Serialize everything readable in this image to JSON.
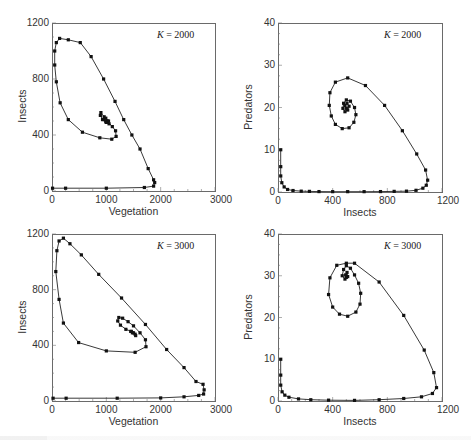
{
  "chart_data": [
    {
      "id": "tl",
      "type": "line",
      "title": "",
      "annotation": {
        "var": "K",
        "text": " = 2000"
      },
      "xlabel": "Vegetation",
      "ylabel": "Insects",
      "xlim": [
        0,
        3000
      ],
      "ylim": [
        0,
        1200
      ],
      "xticks": [
        0,
        1000,
        2000,
        3000
      ],
      "yticks": [
        0,
        400,
        800,
        1200
      ],
      "frame": {
        "left": 52,
        "top": 23,
        "right": 215,
        "bottom": 191
      },
      "grid": false,
      "series": [
        {
          "name": "trajectory",
          "points": [
            [
              10,
              20
            ],
            [
              250,
              20
            ],
            [
              1000,
              20
            ],
            [
              1700,
              25
            ],
            [
              1870,
              35
            ],
            [
              1890,
              60
            ],
            [
              1870,
              80
            ],
            [
              1770,
              160
            ],
            [
              1620,
              300
            ],
            [
              1470,
              400
            ],
            [
              1320,
              510
            ],
            [
              1160,
              640
            ],
            [
              950,
              800
            ],
            [
              720,
              960
            ],
            [
              520,
              1060
            ],
            [
              300,
              1080
            ],
            [
              140,
              1090
            ],
            [
              80,
              1060
            ],
            [
              50,
              1000
            ],
            [
              50,
              900
            ],
            [
              80,
              780
            ],
            [
              150,
              630
            ],
            [
              300,
              510
            ],
            [
              560,
              420
            ],
            [
              880,
              380
            ],
            [
              1100,
              370
            ],
            [
              1180,
              390
            ],
            [
              1170,
              430
            ],
            [
              1110,
              460
            ],
            [
              1020,
              500
            ],
            [
              960,
              530
            ],
            [
              900,
              560
            ],
            [
              890,
              540
            ],
            [
              930,
              510
            ],
            [
              1000,
              490
            ],
            [
              1050,
              480
            ],
            [
              1040,
              500
            ],
            [
              990,
              520
            ],
            [
              960,
              510
            ],
            [
              990,
              495
            ]
          ]
        }
      ]
    },
    {
      "id": "tr",
      "type": "line",
      "title": "",
      "annotation": {
        "var": "K",
        "text": " = 2000"
      },
      "xlabel": "Insects",
      "ylabel": "Predators",
      "xlim": [
        0,
        1200
      ],
      "ylim": [
        0,
        40
      ],
      "xticks": [
        0,
        400,
        800,
        1200
      ],
      "yticks": [
        0,
        10,
        20,
        30,
        40
      ],
      "frame": {
        "left": 278,
        "top": 23,
        "right": 442,
        "bottom": 192
      },
      "grid": false,
      "series": [
        {
          "name": "trajectory",
          "points": [
            [
              20,
              10
            ],
            [
              20,
              6
            ],
            [
              20,
              3.8
            ],
            [
              28,
              2.2
            ],
            [
              45,
              1.2
            ],
            [
              70,
              0.6
            ],
            [
              110,
              0.35
            ],
            [
              170,
              0.2
            ],
            [
              230,
              0.15
            ],
            [
              300,
              0.1
            ],
            [
              400,
              0.08
            ],
            [
              510,
              0.08
            ],
            [
              630,
              0.08
            ],
            [
              750,
              0.1
            ],
            [
              850,
              0.15
            ],
            [
              940,
              0.2
            ],
            [
              1010,
              0.4
            ],
            [
              1060,
              0.9
            ],
            [
              1085,
              1.6
            ],
            [
              1095,
              2.8
            ],
            [
              1080,
              5.2
            ],
            [
              1015,
              9
            ],
            [
              910,
              14.5
            ],
            [
              780,
              20.5
            ],
            [
              640,
              25.2
            ],
            [
              510,
              27
            ],
            [
              420,
              26
            ],
            [
              380,
              23.5
            ],
            [
              375,
              20.5
            ],
            [
              390,
              18
            ],
            [
              420,
              16
            ],
            [
              470,
              15
            ],
            [
              520,
              15.2
            ],
            [
              555,
              16.5
            ],
            [
              570,
              18.3
            ],
            [
              560,
              20
            ],
            [
              530,
              21.5
            ],
            [
              500,
              21.8
            ],
            [
              480,
              21
            ],
            [
              475,
              19.8
            ],
            [
              490,
              19
            ],
            [
              510,
              19.4
            ],
            [
              520,
              20.3
            ],
            [
              505,
              21
            ],
            [
              490,
              20.5
            ],
            [
              500,
              19.8
            ]
          ]
        }
      ]
    },
    {
      "id": "bl",
      "type": "line",
      "title": "",
      "annotation": {
        "var": "K",
        "text": " = 3000"
      },
      "xlabel": "Vegetation",
      "ylabel": "Insects",
      "xlim": [
        0,
        3000
      ],
      "ylim": [
        0,
        1200
      ],
      "xticks": [
        0,
        1000,
        2000,
        3000
      ],
      "yticks": [
        0,
        400,
        800,
        1200
      ],
      "frame": {
        "left": 52,
        "top": 234,
        "right": 215,
        "bottom": 401
      },
      "grid": false,
      "series": [
        {
          "name": "trajectory",
          "points": [
            [
              20,
              20
            ],
            [
              260,
              20
            ],
            [
              1200,
              20
            ],
            [
              2000,
              22
            ],
            [
              2430,
              30
            ],
            [
              2700,
              40
            ],
            [
              2790,
              50
            ],
            [
              2800,
              80
            ],
            [
              2780,
              120
            ],
            [
              2650,
              140
            ],
            [
              2430,
              240
            ],
            [
              2110,
              370
            ],
            [
              1720,
              550
            ],
            [
              1280,
              740
            ],
            [
              860,
              910
            ],
            [
              540,
              1050
            ],
            [
              330,
              1130
            ],
            [
              210,
              1170
            ],
            [
              130,
              1150
            ],
            [
              90,
              1080
            ],
            [
              70,
              930
            ],
            [
              130,
              730
            ],
            [
              210,
              560
            ],
            [
              490,
              420
            ],
            [
              1000,
              360
            ],
            [
              1530,
              350
            ],
            [
              1730,
              390
            ],
            [
              1720,
              440
            ],
            [
              1620,
              490
            ],
            [
              1500,
              540
            ],
            [
              1400,
              570
            ],
            [
              1300,
              595
            ],
            [
              1230,
              600
            ],
            [
              1210,
              575
            ],
            [
              1260,
              545
            ],
            [
              1360,
              515
            ],
            [
              1460,
              500
            ],
            [
              1530,
              480
            ],
            [
              1540,
              470
            ],
            [
              1480,
              490
            ],
            [
              1450,
              500
            ],
            [
              1500,
              490
            ]
          ]
        }
      ]
    },
    {
      "id": "br",
      "type": "line",
      "title": "",
      "annotation": {
        "var": "K",
        "text": " = 3000"
      },
      "xlabel": "Insects",
      "ylabel": "Predators",
      "xlim": [
        0,
        1200
      ],
      "ylim": [
        0,
        40
      ],
      "xticks": [
        0,
        400,
        800,
        1200
      ],
      "yticks": [
        0,
        10,
        20,
        30,
        40
      ],
      "frame": {
        "left": 278,
        "top": 234,
        "right": 442,
        "bottom": 401
      },
      "grid": false,
      "series": [
        {
          "name": "trajectory",
          "points": [
            [
              20,
              10
            ],
            [
              20,
              6.2
            ],
            [
              20,
              3.8
            ],
            [
              30,
              2.2
            ],
            [
              50,
              1.4
            ],
            [
              80,
              0.9
            ],
            [
              150,
              0.5
            ],
            [
              240,
              0.3
            ],
            [
              370,
              0.2
            ],
            [
              560,
              0.15
            ],
            [
              740,
              0.3
            ],
            [
              920,
              0.6
            ],
            [
              1050,
              1
            ],
            [
              1130,
              1.8
            ],
            [
              1160,
              3.2
            ],
            [
              1140,
              6.8
            ],
            [
              1070,
              12.2
            ],
            [
              920,
              20.5
            ],
            [
              740,
              28.5
            ],
            [
              560,
              33
            ],
            [
              500,
              33
            ],
            [
              430,
              32.5
            ],
            [
              380,
              29.5
            ],
            [
              370,
              25.5
            ],
            [
              400,
              22.5
            ],
            [
              450,
              20.8
            ],
            [
              510,
              20.3
            ],
            [
              570,
              21.3
            ],
            [
              600,
              23.2
            ],
            [
              605,
              25.8
            ],
            [
              590,
              28.2
            ],
            [
              560,
              30.2
            ],
            [
              530,
              31.8
            ],
            [
              500,
              32.4
            ],
            [
              480,
              31.5
            ],
            [
              470,
              30
            ],
            [
              490,
              29.2
            ],
            [
              510,
              29.8
            ],
            [
              505,
              30.8
            ],
            [
              495,
              30.2
            ],
            [
              500,
              29.6
            ]
          ]
        }
      ]
    }
  ]
}
